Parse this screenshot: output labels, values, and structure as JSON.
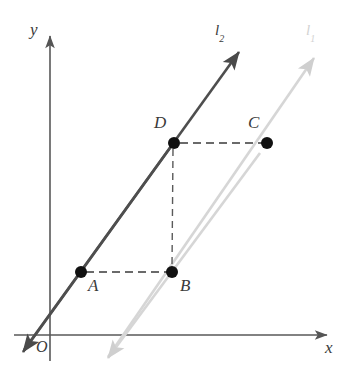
{
  "figure": {
    "type": "geometry-diagram",
    "background_color": "#ffffff",
    "axes": {
      "x_axis_label": "x",
      "y_axis_label": "y",
      "origin_label": "O",
      "axis_color": "#555555",
      "origin": {
        "x": 50,
        "y": 335
      },
      "x_axis_end": {
        "x": 332,
        "y": 335
      },
      "y_axis_top": {
        "x": 50,
        "y": 32
      },
      "y_axis_bottom": {
        "x": 50,
        "y": 361
      }
    },
    "lines": [
      {
        "name": "l2",
        "label": "l",
        "label_subscript": "2",
        "color": "#4a4a4a",
        "style": "solid",
        "arrow_both_ends": true,
        "passes_through": [
          "A",
          "D"
        ],
        "label_pos": {
          "x": 215,
          "y": 24
        },
        "tip_upper": {
          "x": 243,
          "y": 47
        },
        "tip_lower": {
          "x": 19,
          "y": 356
        }
      },
      {
        "name": "l1",
        "label": "l",
        "label_subscript": "1",
        "color": "#d4d4d4",
        "style": "solid",
        "arrow_both_ends": true,
        "passes_through": [
          "B",
          "C"
        ],
        "label_pos": {
          "x": 306,
          "y": 24
        },
        "tip_upper": {
          "x": 318,
          "y": 53
        },
        "tip_lower": {
          "x": 104,
          "y": 362
        }
      }
    ],
    "points": [
      {
        "label": "A",
        "x": 81,
        "y": 272,
        "on_line": "l2",
        "label_pos": {
          "x": 88,
          "y": 278
        },
        "dot_color": "#111111",
        "radius": 6
      },
      {
        "label": "B",
        "x": 172,
        "y": 272,
        "on_line": "l1",
        "label_pos": {
          "x": 180,
          "y": 278
        },
        "dot_color": "#111111",
        "radius": 6
      },
      {
        "label": "C",
        "x": 267,
        "y": 143,
        "on_line": "l1",
        "label_pos": {
          "x": 248,
          "y": 115
        },
        "dot_color": "#111111",
        "radius": 6
      },
      {
        "label": "D",
        "x": 174,
        "y": 143,
        "on_line": "l2",
        "label_pos": {
          "x": 155,
          "y": 115
        },
        "dot_color": "#111111",
        "radius": 6
      }
    ],
    "dashed_segments": [
      {
        "name": "A-to-B",
        "from": "A",
        "to": "B",
        "color": "#333333"
      },
      {
        "name": "D-to-C",
        "from": "D",
        "to": "C",
        "color": "#333333"
      },
      {
        "name": "D-to-B",
        "from": "D",
        "to": "B",
        "color": "#555555"
      }
    ]
  }
}
